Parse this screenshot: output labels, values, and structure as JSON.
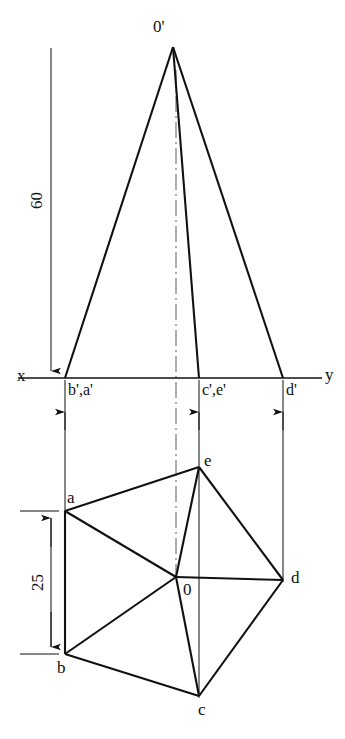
{
  "figure": {
    "background_color": "#ffffff",
    "line_color": "#111111",
    "thick_line_width": 2.1,
    "thin_line_width": 1.0
  },
  "axis": {
    "x_label": "x",
    "y_label": "y",
    "line_y": 378,
    "x_start": 18,
    "x_end": 322
  },
  "dimensions": [
    {
      "name": "height",
      "value": "60",
      "orientation": "vertical",
      "from_y": 48,
      "to_y": 378,
      "at_x": 51
    },
    {
      "name": "base-offset",
      "value": "25",
      "orientation": "vertical",
      "from_y": 511,
      "to_y": 654,
      "at_x": 51
    }
  ],
  "front_view": {
    "apex_label": "0'",
    "apex": {
      "x": 173,
      "y": 47
    },
    "base_points": [
      {
        "label": "b',a'",
        "x": 65,
        "y": 378
      },
      {
        "label": "c',e'",
        "x": 199,
        "y": 378
      },
      {
        "label": "d'",
        "x": 283,
        "y": 378
      }
    ],
    "centerline_x": 176
  },
  "top_view": {
    "center_label": "0",
    "center": {
      "x": 176,
      "y": 577
    },
    "vertices": [
      {
        "label": "a",
        "x": 65,
        "y": 511
      },
      {
        "label": "b",
        "x": 65,
        "y": 654
      },
      {
        "label": "c",
        "x": 199,
        "y": 696
      },
      {
        "label": "d",
        "x": 283,
        "y": 580
      },
      {
        "label": "e",
        "x": 199,
        "y": 467
      }
    ],
    "edges": [
      "a-b",
      "b-c",
      "c-d",
      "d-e",
      "e-a",
      "o-a",
      "o-b",
      "o-c",
      "o-d",
      "o-e"
    ]
  },
  "projectors": [
    {
      "name": "projector-ba",
      "x": 65
    },
    {
      "name": "projector-ce",
      "x": 199
    },
    {
      "name": "projector-d",
      "x": 283
    }
  ],
  "labels": {
    "x": "x",
    "y": "y",
    "apex_front": "0'",
    "base_front_left": "b',a'",
    "base_front_mid": "c',e'",
    "base_front_right": "d'",
    "a": "a",
    "b": "b",
    "c": "c",
    "d": "d",
    "e": "e",
    "o": "0",
    "dim_60": "60",
    "dim_25": "25"
  }
}
